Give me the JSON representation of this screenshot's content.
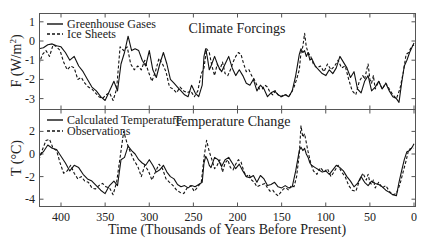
{
  "chart_data": [
    {
      "type": "line",
      "title": "Climate Forcings",
      "xlabel": "Time (Thousands of Years Before Present)",
      "ylabel": "F (W/m²)",
      "xlim": [
        425,
        0
      ],
      "ylim": [
        -3.6,
        1.45
      ],
      "xticks": [
        400,
        350,
        300,
        250,
        200,
        150,
        100,
        50,
        0
      ],
      "yticks": [
        1,
        0,
        -1,
        -2,
        -3
      ],
      "grid": false,
      "legend_position": "upper-left",
      "series": [
        {
          "name": "Greenhouse Gases",
          "style": "solid",
          "x": [
            425,
            420,
            415,
            410,
            405,
            400,
            395,
            390,
            385,
            380,
            375,
            370,
            365,
            360,
            355,
            350,
            345,
            340,
            336,
            332,
            328,
            324,
            320,
            316,
            312,
            308,
            304,
            300,
            296,
            292,
            288,
            284,
            280,
            276,
            272,
            268,
            264,
            260,
            256,
            252,
            248,
            244,
            240,
            238,
            236,
            234,
            232,
            230,
            226,
            222,
            218,
            214,
            210,
            206,
            202,
            198,
            194,
            190,
            186,
            182,
            178,
            174,
            170,
            166,
            162,
            158,
            154,
            150,
            146,
            142,
            138,
            134,
            130,
            128,
            126,
            124,
            122,
            120,
            118,
            116,
            112,
            108,
            104,
            100,
            96,
            92,
            88,
            84,
            80,
            76,
            72,
            68,
            64,
            60,
            56,
            52,
            48,
            44,
            40,
            36,
            32,
            28,
            24,
            20,
            17,
            14,
            11,
            8,
            5,
            2,
            0
          ],
          "y": [
            -0.4,
            -0.35,
            -0.2,
            -0.15,
            -0.25,
            -0.3,
            -0.6,
            -1.0,
            -0.8,
            -1.3,
            -1.6,
            -2.0,
            -2.4,
            -2.6,
            -2.9,
            -3.1,
            -2.6,
            -2.1,
            -2.6,
            -1.2,
            -0.6,
            0.25,
            -0.5,
            -0.4,
            -0.5,
            -1.0,
            -1.3,
            -0.5,
            -1.5,
            -1.9,
            -1.2,
            -0.6,
            -1.2,
            -2.0,
            -2.2,
            -2.4,
            -2.6,
            -2.8,
            -2.9,
            -2.3,
            -2.7,
            -2.9,
            -2.3,
            -0.8,
            -0.4,
            -0.9,
            -1.5,
            -1.3,
            -0.8,
            -1.3,
            -1.6,
            -1.2,
            -0.8,
            -1.4,
            -1.8,
            -1.5,
            -1.8,
            -2.2,
            -2.3,
            -2.0,
            -2.6,
            -2.3,
            -2.5,
            -2.9,
            -2.7,
            -2.6,
            -2.8,
            -2.9,
            -2.8,
            -2.9,
            -2.6,
            -1.8,
            -0.7,
            -0.4,
            -0.6,
            -0.5,
            -0.8,
            -0.6,
            -1.0,
            -0.9,
            -1.3,
            -1.5,
            -1.7,
            -1.8,
            -1.5,
            -1.7,
            -1.4,
            -0.8,
            -1.1,
            -1.4,
            -1.9,
            -1.6,
            -2.5,
            -2.7,
            -2.1,
            -1.8,
            -2.6,
            -2.4,
            -2.1,
            -2.5,
            -2.2,
            -2.6,
            -2.9,
            -3.0,
            -3.2,
            -2.2,
            -1.3,
            -1.0,
            -0.6,
            -0.3,
            -0.1
          ]
        },
        {
          "name": "Ice Sheets",
          "style": "dashed",
          "x": [
            425,
            421,
            417,
            413,
            409,
            405,
            401,
            397,
            393,
            389,
            385,
            381,
            377,
            373,
            369,
            365,
            361,
            357,
            353,
            349,
            345,
            341,
            337,
            333,
            329,
            325,
            321,
            317,
            313,
            309,
            305,
            301,
            297,
            293,
            289,
            285,
            281,
            277,
            273,
            269,
            265,
            261,
            257,
            253,
            249,
            245,
            241,
            238,
            235,
            232,
            229,
            226,
            223,
            220,
            217,
            214,
            211,
            208,
            205,
            202,
            199,
            196,
            193,
            190,
            187,
            184,
            181,
            178,
            175,
            172,
            169,
            166,
            163,
            160,
            157,
            154,
            151,
            148,
            145,
            142,
            139,
            136,
            133,
            130,
            128,
            126,
            124,
            122,
            120,
            117,
            114,
            110,
            106,
            102,
            98,
            94,
            90,
            86,
            82,
            78,
            74,
            70,
            66,
            62,
            58,
            56,
            54,
            52,
            50,
            48,
            46,
            44,
            40,
            36,
            32,
            28,
            24,
            20,
            16,
            12,
            9,
            6,
            3,
            0
          ],
          "y": [
            -1.2,
            -0.7,
            -0.5,
            -0.8,
            -0.2,
            -0.3,
            -0.5,
            -1.1,
            -1.5,
            -1.3,
            -1.4,
            -2.0,
            -1.9,
            -2.2,
            -2.4,
            -2.5,
            -2.7,
            -2.9,
            -3.0,
            -2.8,
            -2.7,
            -3.1,
            -2.5,
            -0.3,
            -0.5,
            -0.3,
            -1.2,
            -1.5,
            -1.3,
            -1.5,
            -1.0,
            -1.6,
            -2.1,
            -1.6,
            -0.9,
            -1.2,
            -1.6,
            -2.4,
            -2.5,
            -2.7,
            -2.4,
            -2.6,
            -2.7,
            -2.6,
            -2.9,
            -2.6,
            -1.7,
            -1.4,
            -0.4,
            -0.6,
            -1.3,
            -1.8,
            -1.2,
            -1.5,
            -1.1,
            -1.7,
            -1.8,
            -1.5,
            -1.1,
            -0.8,
            -0.6,
            -0.7,
            -1.2,
            -1.6,
            -1.5,
            -1.8,
            -2.0,
            -2.3,
            -2.5,
            -2.5,
            -2.3,
            -2.4,
            -2.7,
            -2.8,
            -2.6,
            -2.8,
            -2.9,
            -2.8,
            -2.8,
            -2.9,
            -2.7,
            -2.4,
            -2.0,
            -1.5,
            -0.6,
            -0.3,
            0.4,
            -0.3,
            -0.6,
            -0.8,
            -1.2,
            -1.4,
            -1.3,
            -1.6,
            -1.2,
            -1.5,
            -1.3,
            -1.0,
            -1.4,
            -1.3,
            -2.0,
            -2.6,
            -2.8,
            -2.1,
            -1.8,
            -2.0,
            -1.6,
            -1.2,
            -2.0,
            -2.2,
            -1.8,
            -2.5,
            -2.1,
            -2.5,
            -2.2,
            -2.5,
            -2.8,
            -3.0,
            -2.5,
            -1.6,
            -0.7,
            -0.6,
            -0.3,
            -0.2
          ]
        }
      ]
    },
    {
      "type": "line",
      "title": "Temperature Change",
      "xlabel": "Time (Thousands of Years Before Present)",
      "ylabel": "T (°C)",
      "xlim": [
        425,
        0
      ],
      "ylim": [
        -4.7,
        3.9
      ],
      "xticks": [
        400,
        350,
        300,
        250,
        200,
        150,
        100,
        50,
        0
      ],
      "yticks": [
        2,
        0,
        -2,
        -4
      ],
      "grid": false,
      "legend_position": "upper-left",
      "series": [
        {
          "name": "Calculated Temperature",
          "style": "solid",
          "x": [
            425,
            420,
            415,
            410,
            405,
            400,
            395,
            390,
            385,
            380,
            375,
            370,
            365,
            360,
            355,
            350,
            345,
            340,
            336,
            332,
            328,
            324,
            320,
            316,
            312,
            308,
            304,
            300,
            296,
            292,
            288,
            284,
            280,
            276,
            272,
            268,
            264,
            260,
            256,
            252,
            248,
            244,
            240,
            238,
            236,
            234,
            232,
            230,
            226,
            222,
            218,
            214,
            210,
            206,
            202,
            198,
            194,
            190,
            186,
            182,
            178,
            174,
            170,
            166,
            162,
            158,
            154,
            150,
            146,
            142,
            138,
            134,
            130,
            128,
            126,
            124,
            122,
            120,
            118,
            116,
            112,
            108,
            104,
            100,
            96,
            92,
            88,
            84,
            80,
            76,
            72,
            68,
            64,
            60,
            56,
            52,
            48,
            44,
            40,
            36,
            32,
            28,
            24,
            20,
            17,
            14,
            11,
            8,
            5,
            2,
            0
          ],
          "y": [
            -0.2,
            0.2,
            0.8,
            0.5,
            0.4,
            -0.2,
            -0.8,
            -1.5,
            -1.0,
            -1.2,
            -1.8,
            -2.2,
            -2.4,
            -2.8,
            -3.2,
            -3.5,
            -2.8,
            -2.4,
            -2.8,
            -0.5,
            -0.3,
            0.7,
            0.3,
            0.0,
            -0.5,
            -0.8,
            -1.0,
            -0.5,
            -1.0,
            -1.6,
            -1.4,
            -1.0,
            -1.6,
            -2.0,
            -2.2,
            -2.7,
            -2.9,
            -2.8,
            -3.0,
            -2.8,
            -2.9,
            -2.7,
            -2.5,
            -0.8,
            -0.2,
            -0.5,
            -1.0,
            -1.2,
            -0.3,
            -0.5,
            -1.1,
            -0.5,
            -0.3,
            -0.8,
            -1.3,
            -0.9,
            -1.5,
            -2.0,
            -2.1,
            -1.9,
            -2.5,
            -1.9,
            -2.2,
            -2.8,
            -2.7,
            -2.5,
            -2.9,
            -3.0,
            -2.8,
            -3.0,
            -2.9,
            -1.5,
            0.3,
            0.6,
            0.3,
            0.5,
            0.0,
            -0.3,
            -0.8,
            -1.0,
            -1.2,
            -1.4,
            -1.6,
            -1.5,
            -1.8,
            -1.4,
            -1.0,
            -1.2,
            -1.5,
            -2.0,
            -2.4,
            -2.9,
            -2.6,
            -2.0,
            -2.5,
            -2.8,
            -2.4,
            -2.6,
            -2.7,
            -2.9,
            -3.2,
            -3.4,
            -3.6,
            -3.7,
            -2.5,
            -1.5,
            -0.5,
            0.2,
            0.3,
            0.6,
            0.9
          ]
        },
        {
          "name": "Observations",
          "style": "dashed",
          "x": [
            425,
            421,
            417,
            413,
            409,
            405,
            401,
            397,
            393,
            389,
            385,
            381,
            377,
            373,
            369,
            365,
            361,
            357,
            353,
            349,
            345,
            341,
            337,
            333,
            329,
            325,
            321,
            317,
            313,
            309,
            305,
            301,
            297,
            293,
            289,
            285,
            281,
            277,
            273,
            269,
            265,
            261,
            257,
            253,
            249,
            245,
            241,
            238,
            235,
            232,
            229,
            226,
            223,
            220,
            217,
            214,
            211,
            208,
            205,
            202,
            199,
            196,
            193,
            190,
            187,
            184,
            181,
            178,
            175,
            172,
            169,
            166,
            163,
            160,
            157,
            154,
            151,
            148,
            145,
            142,
            139,
            136,
            133,
            130,
            128,
            126,
            124,
            122,
            120,
            117,
            114,
            110,
            106,
            102,
            98,
            94,
            90,
            86,
            82,
            78,
            74,
            70,
            66,
            62,
            58,
            56,
            54,
            52,
            50,
            48,
            46,
            44,
            40,
            36,
            32,
            28,
            24,
            20,
            16,
            12,
            9,
            6,
            3,
            0
          ],
          "y": [
            -0.5,
            0.4,
            1.2,
            1.3,
            0.5,
            0.3,
            -0.8,
            -1.7,
            -1.5,
            -1.0,
            -1.7,
            -2.2,
            -2.0,
            -2.4,
            -2.5,
            -3.0,
            -3.1,
            -2.8,
            -2.6,
            -2.9,
            -3.0,
            -3.6,
            -2.5,
            -0.3,
            2.0,
            0.9,
            0.1,
            -0.6,
            -1.1,
            -2.0,
            -1.0,
            -1.5,
            -2.3,
            -1.6,
            -0.9,
            -1.3,
            -2.2,
            -2.5,
            -2.8,
            -3.2,
            -3.4,
            -3.5,
            -3.0,
            -2.8,
            -3.3,
            -2.9,
            -2.5,
            -0.3,
            1.2,
            0.2,
            -0.5,
            -1.3,
            -1.0,
            -0.5,
            -1.6,
            -0.8,
            -0.5,
            -1.2,
            -1.4,
            -0.9,
            -0.5,
            -0.7,
            -1.5,
            -2.0,
            -1.8,
            -2.3,
            -2.5,
            -2.9,
            -2.8,
            -2.7,
            -2.6,
            -3.0,
            -3.3,
            -3.2,
            -3.5,
            -3.7,
            -3.4,
            -3.1,
            -3.0,
            -3.2,
            -2.8,
            -2.9,
            -2.0,
            0.0,
            2.5,
            1.5,
            1.8,
            1.0,
            0.2,
            -0.8,
            -1.5,
            -1.8,
            -1.2,
            -1.6,
            -1.3,
            -2.0,
            -1.5,
            -1.0,
            -1.6,
            -2.0,
            -2.8,
            -3.2,
            -3.3,
            -2.4,
            -1.7,
            -2.0,
            -2.3,
            -1.8,
            -2.5,
            -2.7,
            -2.3,
            -3.0,
            -2.5,
            -3.0,
            -2.8,
            -3.3,
            -3.6,
            -3.5,
            -2.7,
            -1.5,
            -0.6,
            0.4,
            0.5,
            0.5
          ]
        }
      ]
    }
  ],
  "labels": {
    "x_axis": "Time (Thousands of Years Before Present)",
    "top_y_axis": "F (W/m",
    "top_y_axis_sup": "2",
    "top_y_axis_close": ")",
    "bottom_y_axis": "T (°C)",
    "top_title": "Climate Forcings",
    "bottom_title": "Temperature Change",
    "legend_top": [
      "Greenhouse Gases",
      "Ice Sheets"
    ],
    "legend_bottom": [
      "Calculated Temperature",
      "Observations"
    ]
  },
  "colors": {
    "line": "#111111",
    "axis": "#444444",
    "background": "#ffffff"
  }
}
